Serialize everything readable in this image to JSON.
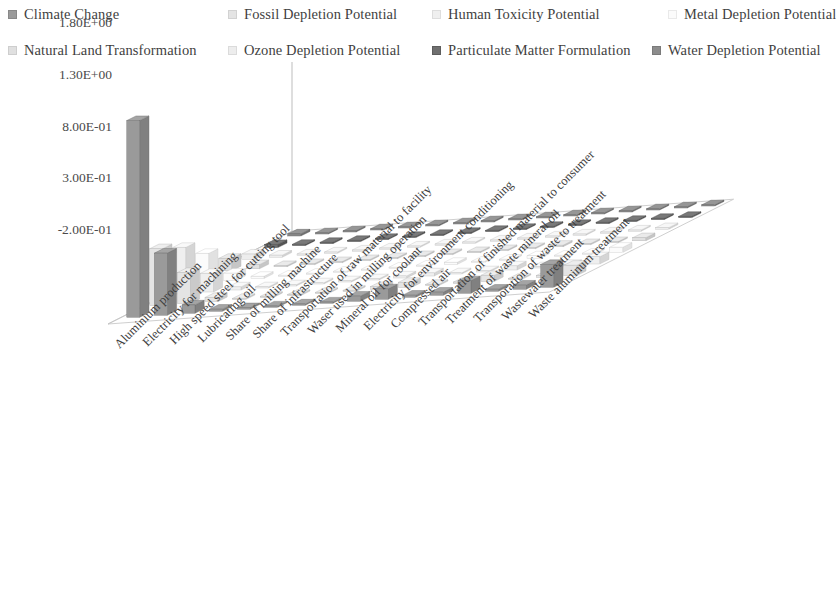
{
  "legend": {
    "position": "top",
    "items": [
      {
        "label": "Climate Change",
        "color": "#9a9a9a",
        "x": 8,
        "y": 6
      },
      {
        "label": "Fossil Depletion Potential",
        "color": "#e4e4e4",
        "x": 228,
        "y": 6
      },
      {
        "label": "Human Toxicity Potential",
        "color": "#efefef",
        "x": 432,
        "y": 6
      },
      {
        "label": "Metal Depletion Potential",
        "color": "#fbfbfb",
        "x": 668,
        "y": 6
      },
      {
        "label": "Natural Land Transformation",
        "color": "#e0e0e0",
        "x": 8,
        "y": 42
      },
      {
        "label": "Ozone Depletion Potential",
        "color": "#ededed",
        "x": 228,
        "y": 42
      },
      {
        "label": "Particulate Matter Formulation",
        "color": "#6f6f6f",
        "x": 432,
        "y": 42
      },
      {
        "label": "Water Depletion Potential",
        "color": "#8c8c8c",
        "x": 652,
        "y": 42
      }
    ]
  },
  "chart_data": {
    "type": "bar",
    "title": "",
    "xlabel": "",
    "ylabel": "",
    "ylim": [
      -0.2,
      1.8
    ],
    "grid": false,
    "projection": "3d",
    "ytick_labels": [
      "1.80E+00",
      "1.30E+00",
      "8.00E-01",
      "3.00E-01",
      "-2.00E-01"
    ],
    "ytick_values": [
      1.8,
      1.3,
      0.8,
      0.3,
      -0.2
    ],
    "categories": [
      "Aluminium production",
      "Electricity for machining",
      "High speed steel for cutting tool",
      "Lubricating oil",
      "Share of milling machine",
      "Share of infrastructure",
      "Transportation of raw material to facility",
      "Waser used in milling operation",
      "Mineral oil for coolant",
      "Electricity for environment conditioning",
      "Compressed air",
      "Transportation of finished material to consumer",
      "Treatment of waste mineral oil",
      "Transporation of waste to treatment",
      "Wastewater treatment",
      "Waste aluminum treatment"
    ],
    "series": [
      {
        "name": "Climate Change",
        "color": "#9a9a9a",
        "values": [
          1.9,
          0.6,
          0.08,
          0.02,
          0.015,
          0.01,
          0.012,
          0.005,
          0.05,
          0.1,
          0.02,
          0.03,
          0.12,
          0.02,
          0.04,
          0.22
        ]
      },
      {
        "name": "Fossil Depletion Potential",
        "color": "#e4e4e4",
        "values": [
          0.55,
          0.3,
          0.04,
          0.01,
          0.008,
          0.006,
          0.007,
          0.003,
          0.03,
          0.05,
          0.01,
          0.015,
          0.06,
          0.01,
          0.02,
          0.1
        ]
      },
      {
        "name": "Human Toxicity Potential",
        "color": "#efefef",
        "values": [
          0.45,
          0.18,
          0.03,
          0.008,
          0.006,
          0.005,
          0.005,
          0.002,
          0.02,
          0.03,
          0.008,
          0.01,
          0.04,
          0.008,
          0.015,
          0.07
        ]
      },
      {
        "name": "Metal Depletion Potential",
        "color": "#fbfbfb",
        "values": [
          0.28,
          0.07,
          0.02,
          0.005,
          0.004,
          0.003,
          0.003,
          0.002,
          0.012,
          0.02,
          0.005,
          0.008,
          0.025,
          0.005,
          0.01,
          0.05
        ]
      },
      {
        "name": "Natural Land Transformation",
        "color": "#e0e0e0",
        "values": [
          0.12,
          0.04,
          0.012,
          0.004,
          0.003,
          0.002,
          0.002,
          0.001,
          0.008,
          0.012,
          0.003,
          0.005,
          0.015,
          0.003,
          0.007,
          0.03
        ]
      },
      {
        "name": "Ozone Depletion Potential",
        "color": "#ededed",
        "values": [
          0.05,
          0.02,
          0.006,
          0.002,
          0.002,
          0.001,
          0.001,
          0.001,
          0.004,
          0.006,
          0.002,
          0.003,
          0.008,
          0.002,
          0.004,
          0.015
        ]
      },
      {
        "name": "Particulate Matter Formulation",
        "color": "#6f6f6f",
        "values": [
          0.03,
          0.012,
          0.004,
          0.002,
          0.001,
          0.001,
          0.001,
          0.001,
          0.003,
          0.004,
          0.001,
          0.002,
          0.005,
          0.001,
          0.003,
          0.01
        ]
      },
      {
        "name": "Water Depletion Potential",
        "color": "#8c8c8c",
        "values": [
          0.02,
          0.008,
          0.003,
          0.001,
          0.001,
          0.001,
          0.001,
          0.001,
          0.002,
          0.003,
          0.001,
          0.001,
          0.003,
          0.001,
          0.002,
          0.008
        ]
      }
    ]
  }
}
